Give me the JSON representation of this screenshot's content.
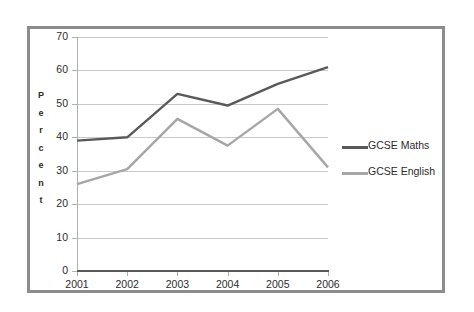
{
  "chart_data": {
    "type": "line",
    "title": "",
    "xlabel": "",
    "ylabel": "Percent",
    "categories": [
      "2001",
      "2002",
      "2003",
      "2004",
      "2005",
      "2006"
    ],
    "yticks": [
      0,
      10,
      20,
      30,
      40,
      50,
      60,
      70
    ],
    "ylim": [
      0,
      70
    ],
    "grid": true,
    "legend_position": "right",
    "series": [
      {
        "name": "GCSE Maths",
        "color": "#595959",
        "values": [
          39,
          40,
          53,
          49.5,
          56,
          61
        ]
      },
      {
        "name": "GCSE English",
        "color": "#a6a6a6",
        "values": [
          26,
          30.5,
          45.5,
          37.5,
          48.5,
          31
        ]
      }
    ]
  },
  "axis": {
    "y_title_letters": [
      "P",
      "e",
      "r",
      "c",
      "e",
      "n",
      "t"
    ]
  },
  "colors": {
    "frame": "#8a8c8e",
    "gridline": "#c9c9c9",
    "axis_line": "#5a5a5a",
    "text": "#2b2b2b"
  }
}
